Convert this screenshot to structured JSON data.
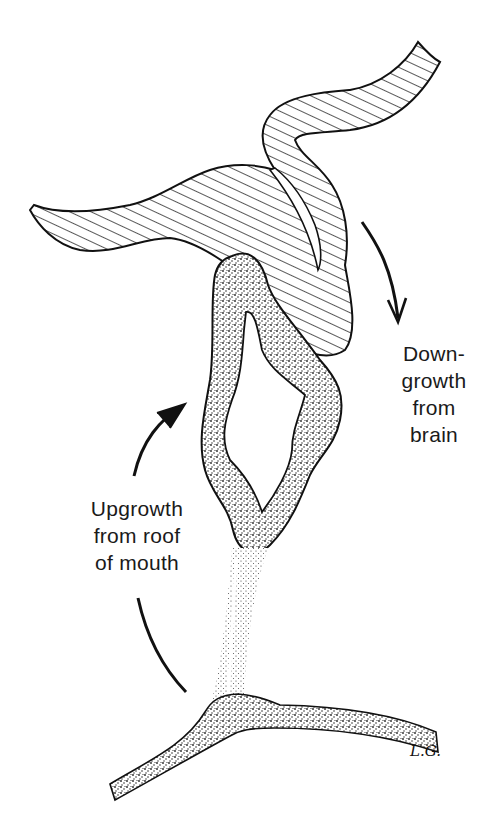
{
  "figure": {
    "labels": {
      "downgrowth": "Down-\ngrowth\nfrom\nbrain",
      "upgrowth": "Upgrowth\nfrom roof\nof mouth"
    },
    "signature": "L.G."
  },
  "colors": {
    "ink": "#111111",
    "background": "#ffffff"
  }
}
